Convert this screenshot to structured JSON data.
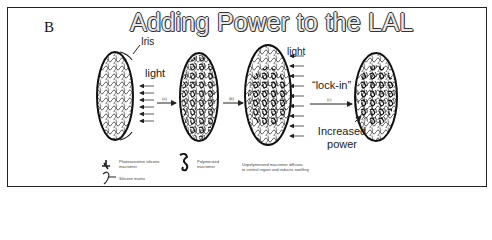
{
  "figure": {
    "panel_letter": "B",
    "title": "Adding Power to the LAL",
    "labels": {
      "iris": "Iris",
      "light_1": "light",
      "light_2": "light",
      "lock_in": "“lock-in”",
      "increased_power_line1": "Increased",
      "increased_power_line2": "power"
    },
    "steps": [
      {
        "label": "(a)"
      },
      {
        "label": "(b)"
      },
      {
        "label": "(c)"
      }
    ],
    "legend": [
      {
        "icon": "photosensitive-macromer-icon",
        "text_line1": "Photosensitive silicone",
        "text_line2": "macromer"
      },
      {
        "icon": "polymerized-macromer-icon",
        "text_line1": "Polymerized",
        "text_line2": "macromer"
      },
      {
        "icon": "silicone-matrix-icon",
        "text_line1": "Silicone matrix",
        "text_line2": ""
      },
      {
        "icon": "",
        "text_line1": "Unpolymerized macromer diffuses",
        "text_line2": "to central region and induces swelling"
      }
    ]
  }
}
